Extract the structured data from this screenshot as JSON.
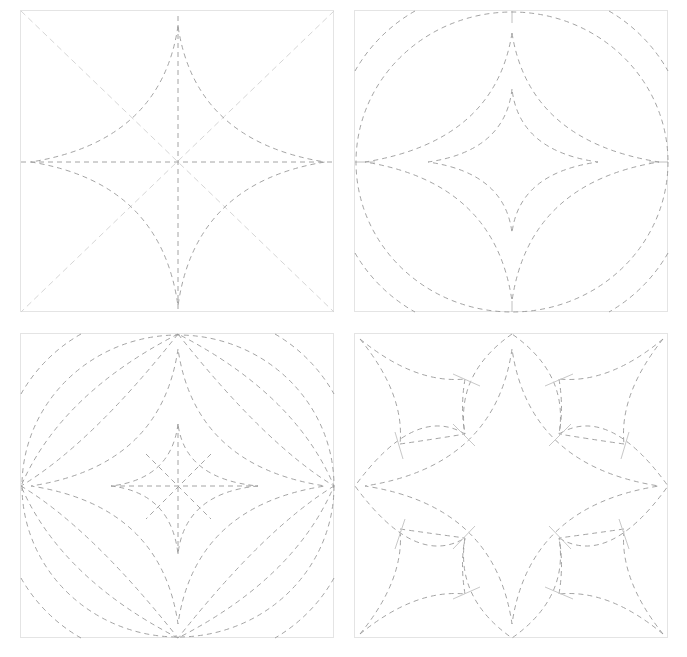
{
  "figure": {
    "colors": {
      "dash": "#9a9a9a",
      "light_dash": "#d6d6d6",
      "border": "#e4e4e4",
      "background": "#ffffff"
    },
    "panels": [
      {
        "id": "step-1",
        "content": "square with diagonals, center cross and concave four-point star"
      },
      {
        "id": "step-2",
        "content": "inscribed circle, corner arcs, outer and inner concave four-point stars"
      },
      {
        "id": "step-3",
        "content": "circle, corner arcs, lens arcs, nested stars and center cross"
      },
      {
        "id": "step-4",
        "content": "eight-petal flower with corner arcs and tick marks"
      }
    ]
  }
}
